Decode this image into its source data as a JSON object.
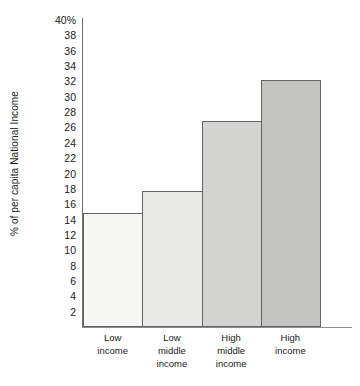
{
  "chart_data": {
    "type": "bar",
    "title": "",
    "subtitle": "",
    "xlabel": "",
    "ylabel": "% of per capita National Income",
    "categories": [
      "Low income",
      "Low middle income",
      "High middle income",
      "High income"
    ],
    "category_lines": [
      [
        "Low",
        "income"
      ],
      [
        "Low",
        "middle",
        "income"
      ],
      [
        "High",
        "middle",
        "income"
      ],
      [
        "High",
        "income"
      ]
    ],
    "values": [
      14.8,
      17.7,
      26.8,
      32.2
    ],
    "ylim": [
      0,
      40
    ],
    "ytick_step": 2,
    "ytick_labels": [
      "40%",
      "38",
      "36",
      "34",
      "32",
      "30",
      "28",
      "26",
      "24",
      "22",
      "20",
      "18",
      "16",
      "14",
      "12",
      "10",
      "8",
      "6",
      "4",
      "2"
    ],
    "ytick_values": [
      40,
      38,
      36,
      34,
      32,
      30,
      28,
      26,
      24,
      22,
      20,
      18,
      16,
      14,
      12,
      10,
      8,
      6,
      4,
      2
    ],
    "grid": false,
    "legend": "none",
    "bar_colors": [
      "#f6f6f4",
      "#e9e9e7",
      "#d3d3d1",
      "#c3c3c1"
    ],
    "bar_border_color": "#646464",
    "axis_color": "#6e6e6e",
    "background": "#ffffff",
    "bar_gap": 0
  }
}
